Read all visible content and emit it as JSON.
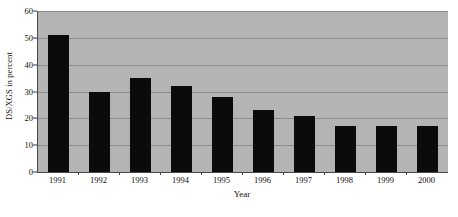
{
  "chart_data": {
    "type": "bar",
    "title": "",
    "xlabel": "Year",
    "ylabel": "DS/XGS in percent",
    "categories": [
      "1991",
      "1992",
      "1993",
      "1994",
      "1995",
      "1996",
      "1997",
      "1998",
      "1999",
      "2000"
    ],
    "values": [
      51,
      30,
      35,
      32,
      28,
      23,
      21,
      17,
      17,
      17
    ],
    "ylim": [
      0,
      60
    ],
    "yticks": [
      0,
      10,
      20,
      30,
      40,
      50,
      60
    ],
    "ytick_labels": [
      "0",
      "10",
      "20",
      "30",
      "40",
      "50",
      "60"
    ],
    "grid": true,
    "grid_axis": "y",
    "legend": null,
    "series": [
      {
        "name": "DS/XGS in percent",
        "values": [
          51,
          30,
          35,
          32,
          28,
          23,
          21,
          17,
          17,
          17
        ],
        "color": "#0b0b0b"
      }
    ]
  },
  "style": {
    "plot_background": "#b4b4b4",
    "bar_color": "#0b0b0b",
    "gridline_color": "#8d8d8d",
    "axis_color": "#4a4a4a",
    "page_background": "#ffffff"
  }
}
